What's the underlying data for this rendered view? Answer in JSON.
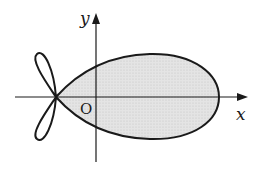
{
  "figure": {
    "labels": {
      "x_axis": "x",
      "y_axis": "y",
      "origin": "O"
    },
    "colors": {
      "fill": "#e0e0e0",
      "stroke": "#1a1a1a",
      "background": "#ffffff"
    }
  }
}
